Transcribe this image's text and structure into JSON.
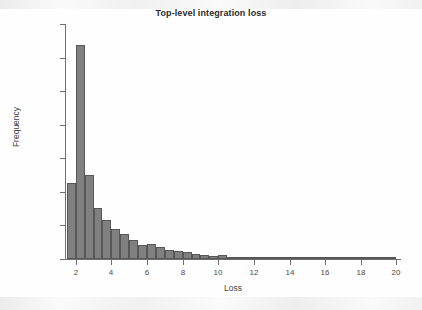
{
  "figure": {
    "title": "Top-level integration loss"
  },
  "chart_data": {
    "type": "bar",
    "title": "Top-level integration loss",
    "xlabel": "Loss",
    "ylabel": "Frequency",
    "xlim": [
      1.4,
      20.2
    ],
    "ylim": [
      0,
      3500
    ],
    "xticks": [
      2,
      4,
      6,
      8,
      10,
      12,
      14,
      16,
      18,
      20
    ],
    "xtick_labels": [
      "2",
      "4",
      "6",
      "8",
      "10",
      "12",
      "14",
      "16",
      "18",
      "20"
    ],
    "yticks": [
      0,
      500,
      1000,
      1500,
      2000,
      2500,
      3000,
      3500
    ],
    "ytick_labels": [
      "0",
      "500",
      "1000",
      "1500",
      "2000",
      "2500",
      "3000",
      "3500"
    ],
    "grid": false,
    "legend": null,
    "bin_width": 0.5,
    "bar_color": "#808080",
    "bar_edge_color": "#575757",
    "bin_starts": [
      1.5,
      2.0,
      2.5,
      3.0,
      3.5,
      4.0,
      4.5,
      5.0,
      5.5,
      6.0,
      6.5,
      7.0,
      7.5,
      8.0,
      8.5,
      9.0,
      9.5,
      10.0,
      10.5,
      11.0,
      11.5,
      12.0,
      12.5,
      13.0,
      13.5,
      14.0,
      14.5,
      15.0,
      15.5,
      16.0,
      16.5,
      17.0,
      17.5,
      18.0,
      18.5,
      19.0,
      19.5
    ],
    "categories": [
      "1.5-2.0",
      "2.0-2.5",
      "2.5-3.0",
      "3.0-3.5",
      "3.5-4.0",
      "4.0-4.5",
      "4.5-5.0",
      "5.0-5.5",
      "5.5-6.0",
      "6.0-6.5",
      "6.5-7.0",
      "7.0-7.5",
      "7.5-8.0",
      "8.0-8.5",
      "8.5-9.0",
      "9.0-9.5",
      "9.5-10.0",
      "10.0-10.5",
      "10.5-11.0",
      "11.0-11.5",
      "11.5-12.0",
      "12.0-12.5",
      "12.5-13.0",
      "13.0-13.5",
      "13.5-14.0",
      "14.0-14.5",
      "14.5-15.0",
      "15.0-15.5",
      "15.5-16.0",
      "16.0-16.5",
      "16.5-17.0",
      "17.0-17.5",
      "17.5-18.0",
      "18.0-18.5",
      "18.5-19.0",
      "19.0-19.5",
      "19.5-20.0"
    ],
    "values": [
      1135,
      3190,
      1250,
      765,
      575,
      450,
      375,
      285,
      215,
      220,
      175,
      140,
      120,
      105,
      75,
      65,
      50,
      60,
      28,
      25,
      20,
      16,
      14,
      12,
      10,
      9,
      8,
      14,
      6,
      5,
      4,
      12,
      4,
      3,
      3,
      2,
      2
    ]
  }
}
